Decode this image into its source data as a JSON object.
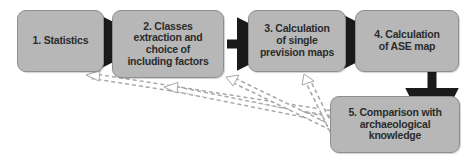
{
  "diagram": {
    "type": "flowchart",
    "canvas": {
      "width": 474,
      "height": 164,
      "background": "#ffffff"
    },
    "style": {
      "node_fill": "#b7b7b7",
      "node_stroke": "#8f8f8f",
      "node_text": "#2b2b2b",
      "solid_arrow_color": "#1a1a1a",
      "dashed_arrow_fill": "#ffffff",
      "dashed_arrow_stroke": "#a8a8a8"
    },
    "nodes": [
      {
        "id": "1",
        "label": "1. Statistics"
      },
      {
        "id": "2",
        "label": "2. Classes\nextraction and\nchoice of\nincluding factors"
      },
      {
        "id": "3",
        "label": "3. Calculation\nof single\nprevision maps"
      },
      {
        "id": "4",
        "label": "4. Calculation\nof ASE map"
      },
      {
        "id": "5",
        "label": "5. Comparison with\narchaeological\nknowledge"
      }
    ],
    "edges": [
      {
        "from": "1",
        "to": "2",
        "style": "solid",
        "direction": "right"
      },
      {
        "from": "2",
        "to": "3",
        "style": "solid",
        "direction": "right"
      },
      {
        "from": "3",
        "to": "4",
        "style": "solid",
        "direction": "right"
      },
      {
        "from": "4",
        "to": "5",
        "style": "solid",
        "direction": "down"
      },
      {
        "from": "5",
        "to": "1",
        "style": "dashed",
        "direction": "feedback-left"
      },
      {
        "from": "5",
        "to": "2",
        "style": "dashed",
        "direction": "feedback-left"
      },
      {
        "from": "5",
        "to": "3",
        "style": "dashed",
        "direction": "feedback-left"
      },
      {
        "from": "5",
        "to": "2b",
        "style": "dashed",
        "direction": "feedback-left"
      }
    ]
  }
}
